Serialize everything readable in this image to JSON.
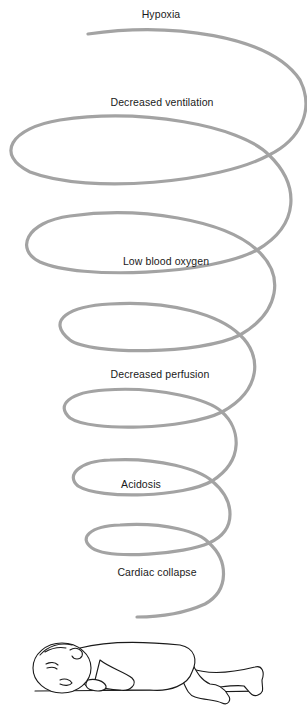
{
  "diagram": {
    "type": "downward spiral",
    "stages": [
      {
        "label": "Hypoxia",
        "x": 161,
        "y": 8
      },
      {
        "label": "Decreased ventilation",
        "x": 162,
        "y": 96
      },
      {
        "label": "Low blood oxygen",
        "x": 166,
        "y": 255
      },
      {
        "label": "Decreased perfusion",
        "x": 160,
        "y": 368
      },
      {
        "label": "Acidosis",
        "x": 141,
        "y": 478
      },
      {
        "label": "Cardiac collapse",
        "x": 157,
        "y": 566
      }
    ],
    "spiral_color": "#a3a3a3",
    "text_color": "#1a1a1a",
    "illustration": "infant lying on side"
  }
}
